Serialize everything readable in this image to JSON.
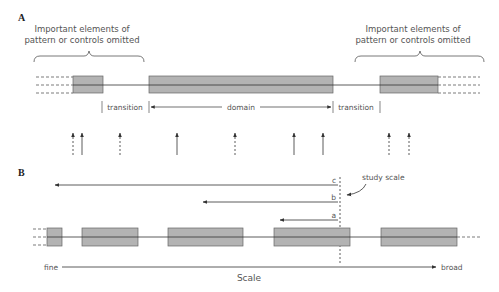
{
  "panel_a": {
    "label": "A",
    "left_note": [
      "Important elements of",
      "pattern or controls omitted"
    ],
    "right_note": [
      "Important elements of",
      "pattern or controls omitted"
    ],
    "transition_left": "transition",
    "domain": "domain",
    "transition_right": "transition"
  },
  "panel_b": {
    "label": "B",
    "study_scale": "study scale",
    "scale_c": "c",
    "scale_b": "b",
    "scale_a": "a",
    "fine": "fine",
    "broad": "broad",
    "axis": "Scale"
  },
  "colors": {
    "box_fill": "#b3b3b3",
    "box_stroke": "#666666",
    "line": "#333333",
    "text": "#555555"
  }
}
